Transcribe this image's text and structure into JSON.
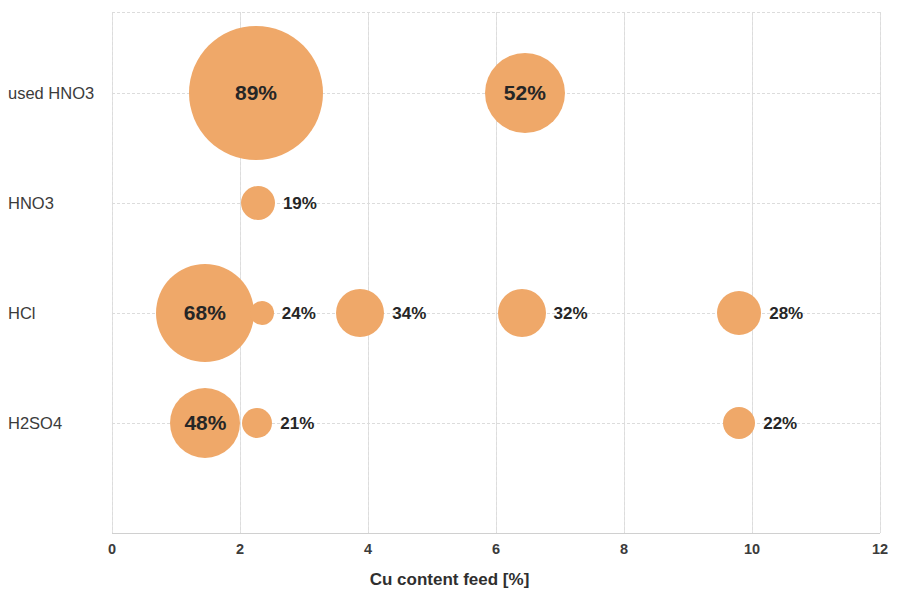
{
  "chart_data": {
    "type": "scatter",
    "subtype": "bubble",
    "title": "",
    "xlabel": "Cu content feed [%]",
    "ylabel": "",
    "xlim": [
      0,
      12
    ],
    "xticks": [
      "0",
      "2",
      "4",
      "6",
      "8",
      "10",
      "12"
    ],
    "categories": [
      "used HNO3",
      "HNO3",
      "HCl",
      "H2SO4"
    ],
    "grid": true,
    "legend": "none",
    "bubble_color": "#EFA869",
    "label_color": "#262626",
    "points": [
      {
        "category": "used HNO3",
        "x": 2.25,
        "label": "89%",
        "value": 89,
        "radius_px": 67,
        "label_position": "inside"
      },
      {
        "category": "used HNO3",
        "x": 6.45,
        "label": "52%",
        "value": 52,
        "radius_px": 40,
        "label_position": "inside"
      },
      {
        "category": "HNO3",
        "x": 2.28,
        "label": "19%",
        "value": 19,
        "radius_px": 17,
        "label_position": "right"
      },
      {
        "category": "HCl",
        "x": 1.45,
        "label": "68%",
        "value": 68,
        "radius_px": 49,
        "label_position": "inside"
      },
      {
        "category": "HCl",
        "x": 2.34,
        "label": "24%",
        "value": 24,
        "radius_px": 12,
        "label_position": "right"
      },
      {
        "category": "HCl",
        "x": 3.88,
        "label": "34%",
        "value": 34,
        "radius_px": 24,
        "label_position": "right"
      },
      {
        "category": "HCl",
        "x": 6.4,
        "label": "32%",
        "value": 32,
        "radius_px": 24,
        "label_position": "right"
      },
      {
        "category": "HCl",
        "x": 9.8,
        "label": "28%",
        "value": 28,
        "radius_px": 22,
        "label_position": "right"
      },
      {
        "category": "H2SO4",
        "x": 1.46,
        "label": "48%",
        "value": 48,
        "radius_px": 35,
        "label_position": "inside"
      },
      {
        "category": "H2SO4",
        "x": 2.27,
        "label": "21%",
        "value": 21,
        "radius_px": 15,
        "label_position": "right"
      },
      {
        "category": "H2SO4",
        "x": 9.8,
        "label": "22%",
        "value": 22,
        "radius_px": 16,
        "label_position": "right"
      }
    ]
  }
}
